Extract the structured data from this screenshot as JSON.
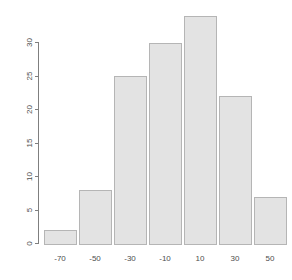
{
  "chart_data": {
    "type": "bar",
    "title": "",
    "subtitle": "",
    "xlabel": "",
    "ylabel": "",
    "categories": [
      "-70",
      "-50",
      "-30",
      "-10",
      "10",
      "30",
      "50"
    ],
    "values": [
      2,
      8,
      25,
      30,
      34,
      22,
      7
    ],
    "bin_edges": [
      -80,
      -60,
      -40,
      -20,
      0,
      20,
      40,
      60
    ],
    "series": [
      {
        "name": "Frequency",
        "values": [
          2,
          8,
          25,
          30,
          34,
          22,
          7
        ]
      }
    ],
    "xlim": [
      -80,
      60
    ],
    "ylim": [
      0,
      34
    ],
    "x_ticks": [
      "-70",
      "-50",
      "-30",
      "-10",
      "10",
      "30",
      "50"
    ],
    "x_tick_values": [
      -70,
      -50,
      -30,
      -10,
      10,
      30,
      50
    ],
    "y_ticks": [
      "0",
      "5",
      "10",
      "15",
      "20",
      "25",
      "30"
    ],
    "y_tick_values": [
      0,
      5,
      10,
      15,
      20,
      25,
      30
    ],
    "grid": false,
    "legend": null,
    "legend_position": "none",
    "annotations": [],
    "bar_fill_color": "#e3e3e3",
    "bar_border_color": "#b5b5b5",
    "axis_color": "#7f7f7f",
    "text_color": "#4d4d4d",
    "background_color": "#ffffff",
    "y_axis_label_rotation": -90
  }
}
